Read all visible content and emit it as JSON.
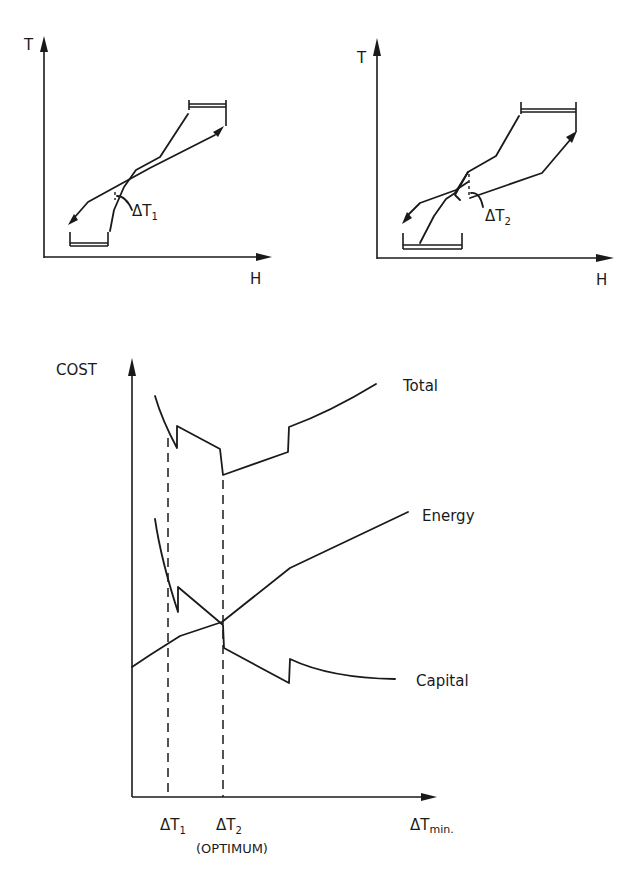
{
  "diagram": {
    "type": "pinch-analysis-delta-tmin-tradeoff",
    "composite_curves_left": {
      "y_axis_label": "T",
      "x_axis_label": "H",
      "delta_label": "ΔT",
      "delta_subscript": "1"
    },
    "composite_curves_right": {
      "y_axis_label": "T",
      "x_axis_label": "H",
      "delta_label": "ΔT",
      "delta_subscript": "2"
    },
    "cost_chart": {
      "y_axis_label": "COST",
      "x_axis_label": "ΔT",
      "x_axis_subscript": "min.",
      "series": [
        {
          "name": "Total",
          "label": "Total"
        },
        {
          "name": "Energy",
          "label": "Energy"
        },
        {
          "name": "Capital",
          "label": "Capital"
        }
      ],
      "x_markers": [
        {
          "label": "ΔT",
          "subscript": "1"
        },
        {
          "label": "ΔT",
          "subscript": "2",
          "note": "(OPTIMUM)"
        }
      ]
    }
  }
}
